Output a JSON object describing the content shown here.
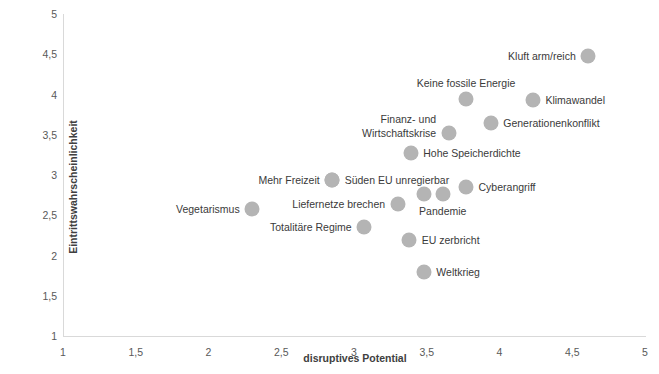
{
  "chart_data": {
    "type": "scatter",
    "title": "",
    "xlabel": "disruptives Potential",
    "ylabel": "Eintrittswahrscheinlichkeit",
    "xlim": [
      1,
      5
    ],
    "ylim": [
      1,
      5
    ],
    "xticks": [
      "1",
      "1,5",
      "2",
      "2,5",
      "3",
      "3,5",
      "4",
      "4,5",
      "5"
    ],
    "xtick_values": [
      1,
      1.5,
      2,
      2.5,
      3,
      3.5,
      4,
      4.5,
      5
    ],
    "yticks": [
      "1",
      "1,5",
      "2",
      "2,5",
      "3",
      "3,5",
      "4",
      "4,5",
      "5"
    ],
    "ytick_values": [
      1,
      1.5,
      2,
      2.5,
      3,
      3.5,
      4,
      4.5,
      5
    ],
    "grid": false,
    "legend": false,
    "marker_color": "#b4b4b4",
    "points": [
      {
        "label": "Kluft arm/reich",
        "x": 4.61,
        "y": 4.48,
        "label_pos": "left"
      },
      {
        "label": "Keine fossile Energie",
        "x": 3.77,
        "y": 3.94,
        "label_pos": "center_above"
      },
      {
        "label": "Klimawandel",
        "x": 4.23,
        "y": 3.93,
        "label_pos": "right"
      },
      {
        "label": "Generationenkonflikt",
        "x": 3.94,
        "y": 3.65,
        "label_pos": "right"
      },
      {
        "label": "Finanz- und",
        "x": 3.65,
        "y": 3.52,
        "label_pos": "left_line1"
      },
      {
        "label": "Wirtschaftskrise",
        "x": 3.65,
        "y": 3.52,
        "label_pos": "left_line2"
      },
      {
        "label": "Hohe Speicherdichte",
        "x": 3.39,
        "y": 3.27,
        "label_pos": "right"
      },
      {
        "label": "Mehr Freizeit",
        "x": 2.85,
        "y": 2.94,
        "label_pos": "left"
      },
      {
        "label": "Süden EU unregierbar",
        "x": 2.85,
        "y": 2.94,
        "label_pos": "right"
      },
      {
        "label": "Liefernetze brechen",
        "x": 3.3,
        "y": 2.64,
        "label_pos": "left"
      },
      {
        "label": "Cyberangriff",
        "x": 3.77,
        "y": 2.85,
        "label_pos": "right"
      },
      {
        "label": "Pandemie",
        "x": 3.61,
        "y": 2.76,
        "label_pos": "below"
      },
      {
        "label": "",
        "x": 3.48,
        "y": 2.76,
        "label_pos": "none"
      },
      {
        "label": "Vegetarismus",
        "x": 2.3,
        "y": 2.58,
        "label_pos": "left"
      },
      {
        "label": "Totalitäre Regime",
        "x": 3.07,
        "y": 2.35,
        "label_pos": "left"
      },
      {
        "label": "EU zerbricht",
        "x": 3.38,
        "y": 2.19,
        "label_pos": "right"
      },
      {
        "label": "Weltkrieg",
        "x": 3.48,
        "y": 1.8,
        "label_pos": "right"
      }
    ]
  }
}
